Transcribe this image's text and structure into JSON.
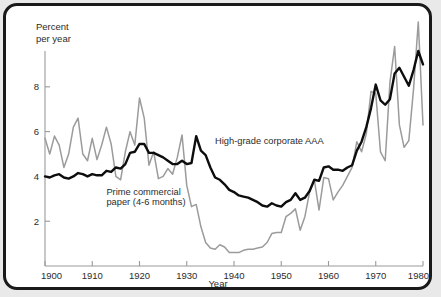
{
  "chart_data": {
    "type": "line",
    "title": "",
    "xlabel": "Year",
    "ylabel": "Percent per year",
    "ylabel_line1": "Percent",
    "ylabel_line2": "per year",
    "xlim": [
      1900,
      1980
    ],
    "ylim": [
      0,
      9.6
    ],
    "grid": false,
    "legend_position": "inline-annotations",
    "xticks": [
      1900,
      1910,
      1920,
      1930,
      1940,
      1950,
      1960,
      1970,
      1980
    ],
    "xtick_labels": [
      "1900",
      "1910",
      "1920",
      "1930",
      "1940",
      "1950",
      "1960",
      "1970",
      "1980"
    ],
    "yticks": [
      2,
      4,
      6,
      8
    ],
    "ytick_labels": [
      "2",
      "4",
      "6",
      "8"
    ],
    "annotations": [
      {
        "text": "High-grade corporate AAA",
        "x": 1936,
        "y": 5.45
      },
      {
        "text": "Prime commercial",
        "x": 1913,
        "y": 3.18
      },
      {
        "text": "paper (4-6 months)",
        "x": 1913,
        "y": 2.73
      }
    ],
    "colors": {
      "high_grade_corporate_aaa": "#0d0d0d",
      "prime_commercial_paper": "#9b9b9b",
      "axis": "#9a9a9a",
      "frame": "#1a1a1a",
      "page_background": "#e9e9e9",
      "plot_background": "#ffffff"
    },
    "series": [
      {
        "name": "High-grade corporate AAA",
        "color": "#0d0d0d",
        "x": [
          1900,
          1901,
          1902,
          1903,
          1904,
          1905,
          1906,
          1907,
          1908,
          1909,
          1910,
          1911,
          1912,
          1913,
          1914,
          1915,
          1916,
          1917,
          1918,
          1919,
          1920,
          1921,
          1922,
          1923,
          1924,
          1925,
          1926,
          1927,
          1928,
          1929,
          1930,
          1931,
          1932,
          1933,
          1934,
          1935,
          1936,
          1937,
          1938,
          1939,
          1940,
          1941,
          1942,
          1943,
          1944,
          1945,
          1946,
          1947,
          1948,
          1949,
          1950,
          1951,
          1952,
          1953,
          1954,
          1955,
          1956,
          1957,
          1958,
          1959,
          1960,
          1961,
          1962,
          1963,
          1964,
          1965,
          1966,
          1967,
          1968,
          1969,
          1970,
          1971,
          1972,
          1973,
          1974,
          1975,
          1976,
          1977,
          1978,
          1979,
          1980
        ],
        "values": [
          4.0,
          3.95,
          4.05,
          4.1,
          3.95,
          3.9,
          4.0,
          4.15,
          4.1,
          4.0,
          4.1,
          4.05,
          4.05,
          4.25,
          4.2,
          4.4,
          4.35,
          4.55,
          5.05,
          5.1,
          5.45,
          5.45,
          5.05,
          5.05,
          4.95,
          4.85,
          4.7,
          4.55,
          4.55,
          4.7,
          4.55,
          4.6,
          5.8,
          5.15,
          4.95,
          4.4,
          3.95,
          3.85,
          3.65,
          3.4,
          3.3,
          3.15,
          3.1,
          3.05,
          2.95,
          2.85,
          2.7,
          2.65,
          2.8,
          2.7,
          2.65,
          2.85,
          2.95,
          3.25,
          2.95,
          3.05,
          3.35,
          3.85,
          3.8,
          4.4,
          4.45,
          4.3,
          4.3,
          4.25,
          4.4,
          4.5,
          5.15,
          5.55,
          6.2,
          7.05,
          8.1,
          7.4,
          7.2,
          7.45,
          8.6,
          8.85,
          8.45,
          8.05,
          8.75,
          9.6,
          9.0
        ]
      },
      {
        "name": "Prime commercial paper (4-6 months)",
        "color": "#9b9b9b",
        "x": [
          1900,
          1901,
          1902,
          1903,
          1904,
          1905,
          1906,
          1907,
          1908,
          1909,
          1910,
          1911,
          1912,
          1913,
          1914,
          1915,
          1916,
          1917,
          1918,
          1919,
          1920,
          1921,
          1922,
          1923,
          1924,
          1925,
          1926,
          1927,
          1928,
          1929,
          1930,
          1931,
          1932,
          1933,
          1934,
          1935,
          1936,
          1937,
          1938,
          1939,
          1940,
          1941,
          1942,
          1943,
          1944,
          1945,
          1946,
          1947,
          1948,
          1949,
          1950,
          1951,
          1952,
          1953,
          1954,
          1955,
          1956,
          1957,
          1958,
          1959,
          1960,
          1961,
          1962,
          1963,
          1964,
          1965,
          1966,
          1967,
          1968,
          1969,
          1970,
          1971,
          1972,
          1973,
          1974,
          1975,
          1976,
          1977,
          1978,
          1979,
          1980
        ],
        "values": [
          5.7,
          5.0,
          5.8,
          5.4,
          4.4,
          5.0,
          6.2,
          6.6,
          5.0,
          4.7,
          5.7,
          4.75,
          5.4,
          6.2,
          5.45,
          4.0,
          3.85,
          5.1,
          6.0,
          5.4,
          7.5,
          6.6,
          4.5,
          5.1,
          3.9,
          4.0,
          4.35,
          4.1,
          4.85,
          5.85,
          3.6,
          2.65,
          2.75,
          1.75,
          1.05,
          0.8,
          0.75,
          0.95,
          0.85,
          0.6,
          0.6,
          0.6,
          0.7,
          0.75,
          0.75,
          0.8,
          0.85,
          1.05,
          1.45,
          1.5,
          1.5,
          2.2,
          2.35,
          2.55,
          1.6,
          2.2,
          3.3,
          3.85,
          2.5,
          3.95,
          3.9,
          2.95,
          3.3,
          3.6,
          4.0,
          4.4,
          5.55,
          5.1,
          5.9,
          7.8,
          7.7,
          5.1,
          4.7,
          8.2,
          9.8,
          6.3,
          5.3,
          5.6,
          7.9,
          10.9,
          6.3
        ]
      }
    ]
  },
  "figure": {
    "y_axis_caption_line1": "Percent",
    "y_axis_caption_line2": "per year",
    "x_axis_caption": "Year"
  }
}
